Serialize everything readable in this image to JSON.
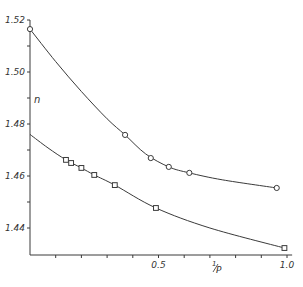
{
  "chart_data": {
    "type": "line",
    "title": "",
    "xlabel": "1/P",
    "ylabel": "n",
    "xlim": [
      0,
      1.0
    ],
    "ylim": [
      1.43,
      1.52
    ],
    "grid": false,
    "x_ticks": [
      0.1,
      0.2,
      0.3,
      0.4,
      0.5,
      0.6,
      0.7,
      0.8,
      0.9,
      1.0
    ],
    "x_tick_labels": [
      {
        "value": 0.5,
        "label": "0.5"
      },
      {
        "value": 1.0,
        "label": "1.0"
      }
    ],
    "y_ticks": [
      1.44,
      1.45,
      1.46,
      1.47,
      1.48,
      1.49,
      1.5,
      1.51,
      1.52
    ],
    "y_tick_labels": [
      {
        "value": 1.52,
        "label": "1.52"
      },
      {
        "value": 1.5,
        "label": "1.50"
      },
      {
        "value": 1.48,
        "label": "1.48"
      },
      {
        "value": 1.46,
        "label": "1.46"
      },
      {
        "value": 1.44,
        "label": "1.44"
      }
    ],
    "series": [
      {
        "name": "upper (circles)",
        "marker": "circle",
        "points": [
          {
            "x": 0.0,
            "y": 1.5165
          },
          {
            "x": 0.37,
            "y": 1.4758
          },
          {
            "x": 0.47,
            "y": 1.4669
          },
          {
            "x": 0.54,
            "y": 1.4635
          },
          {
            "x": 0.62,
            "y": 1.4612
          },
          {
            "x": 0.96,
            "y": 1.4554
          }
        ],
        "curve": [
          [
            0.0,
            1.5165
          ],
          [
            0.1,
            1.504
          ],
          [
            0.2,
            1.4925
          ],
          [
            0.3,
            1.482
          ],
          [
            0.37,
            1.4758
          ],
          [
            0.45,
            1.4685
          ],
          [
            0.54,
            1.4635
          ],
          [
            0.62,
            1.4612
          ],
          [
            0.75,
            1.4585
          ],
          [
            0.96,
            1.4554
          ]
        ]
      },
      {
        "name": "lower (squares)",
        "marker": "square",
        "points": [
          {
            "x": 0.14,
            "y": 1.4662
          },
          {
            "x": 0.16,
            "y": 1.465
          },
          {
            "x": 0.2,
            "y": 1.4631
          },
          {
            "x": 0.25,
            "y": 1.4604
          },
          {
            "x": 0.33,
            "y": 1.4565
          },
          {
            "x": 0.49,
            "y": 1.4477
          },
          {
            "x": 0.99,
            "y": 1.4323
          }
        ],
        "curve": [
          [
            0.0,
            1.476
          ],
          [
            0.07,
            1.4708
          ],
          [
            0.14,
            1.4662
          ],
          [
            0.2,
            1.4631
          ],
          [
            0.25,
            1.4604
          ],
          [
            0.33,
            1.4565
          ],
          [
            0.49,
            1.4477
          ],
          [
            0.7,
            1.44
          ],
          [
            0.99,
            1.4323
          ]
        ]
      }
    ]
  },
  "labels": {
    "y_axis": "n",
    "x_axis_numer": "1",
    "x_axis_denom": "P"
  }
}
